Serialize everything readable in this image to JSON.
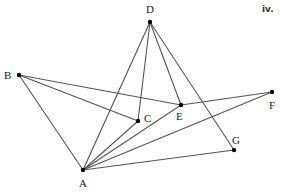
{
  "figure_label": "iv.",
  "vertices": [
    {
      "id": "A",
      "label": "A",
      "x": 83,
      "y": 170,
      "lx": 79,
      "ly": 187
    },
    {
      "id": "B",
      "label": "B",
      "x": 19,
      "y": 75,
      "lx": 4,
      "ly": 79
    },
    {
      "id": "C",
      "label": "C",
      "x": 138,
      "y": 121,
      "lx": 144,
      "ly": 122
    },
    {
      "id": "D",
      "label": "D",
      "x": 150,
      "y": 22,
      "lx": 146,
      "ly": 13
    },
    {
      "id": "E",
      "label": "E",
      "x": 181,
      "y": 105,
      "lx": 176,
      "ly": 120
    },
    {
      "id": "F",
      "label": "F",
      "x": 272,
      "y": 92,
      "lx": 269,
      "ly": 109
    },
    {
      "id": "G",
      "label": "G",
      "x": 234,
      "y": 150,
      "lx": 232,
      "ly": 144
    }
  ],
  "edges": [
    [
      "D",
      "A"
    ],
    [
      "D",
      "C"
    ],
    [
      "D",
      "E"
    ],
    [
      "D",
      "G"
    ],
    [
      "B",
      "A"
    ],
    [
      "B",
      "C"
    ],
    [
      "B",
      "E"
    ],
    [
      "E",
      "F"
    ],
    [
      "A",
      "C"
    ],
    [
      "A",
      "E"
    ],
    [
      "A",
      "F"
    ],
    [
      "A",
      "G"
    ]
  ],
  "colors": {
    "edge": "#555555",
    "vertex": "#000000",
    "label": "#222222"
  }
}
